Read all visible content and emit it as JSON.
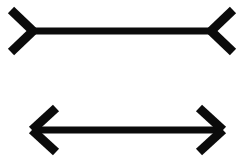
{
  "figure": {
    "name": "muller-lyer-illusion",
    "background_color": "#ffffff",
    "ink_color": "#0b0b0b",
    "canvas": {
      "width": 243,
      "height": 157
    },
    "shafts": [
      {
        "id": "top-shaft",
        "label": "Top shaft (fins outward)",
        "x1": 33,
        "y1": 31,
        "x2": 211,
        "y2": 31,
        "thickness": 7,
        "length_px": 178
      },
      {
        "id": "bottom-shaft",
        "label": "Bottom shaft (fins inward)",
        "x1": 33,
        "y1": 130,
        "x2": 222,
        "y2": 130,
        "thickness": 7,
        "length_px": 189
      }
    ],
    "fins": [
      {
        "id": "top-left-fin-upper",
        "label": "Top left fin, upper, pointing outward",
        "x1": 33,
        "y1": 31,
        "x2": 11,
        "y2": 10,
        "thickness": 9
      },
      {
        "id": "top-left-fin-lower",
        "label": "Top left fin, lower, pointing outward",
        "x1": 33,
        "y1": 31,
        "x2": 11,
        "y2": 52,
        "thickness": 9
      },
      {
        "id": "top-right-fin-upper",
        "label": "Top right fin, upper, pointing outward",
        "x1": 211,
        "y1": 31,
        "x2": 233,
        "y2": 10,
        "thickness": 9
      },
      {
        "id": "top-right-fin-lower",
        "label": "Top right fin, lower, pointing outward",
        "x1": 211,
        "y1": 31,
        "x2": 233,
        "y2": 52,
        "thickness": 9
      },
      {
        "id": "bottom-left-fin-upper",
        "label": "Bottom left arrowhead, upper, pointing inward",
        "x1": 32,
        "y1": 130,
        "x2": 56,
        "y2": 108,
        "thickness": 9
      },
      {
        "id": "bottom-left-fin-lower",
        "label": "Bottom left arrowhead, lower, pointing inward",
        "x1": 32,
        "y1": 130,
        "x2": 56,
        "y2": 152,
        "thickness": 9
      },
      {
        "id": "bottom-right-fin-upper",
        "label": "Bottom right arrowhead, upper, pointing inward",
        "x1": 223,
        "y1": 130,
        "x2": 199,
        "y2": 108,
        "thickness": 9
      },
      {
        "id": "bottom-right-fin-lower",
        "label": "Bottom right arrowhead, lower, pointing inward",
        "x1": 223,
        "y1": 130,
        "x2": 199,
        "y2": 152,
        "thickness": 9
      }
    ]
  }
}
